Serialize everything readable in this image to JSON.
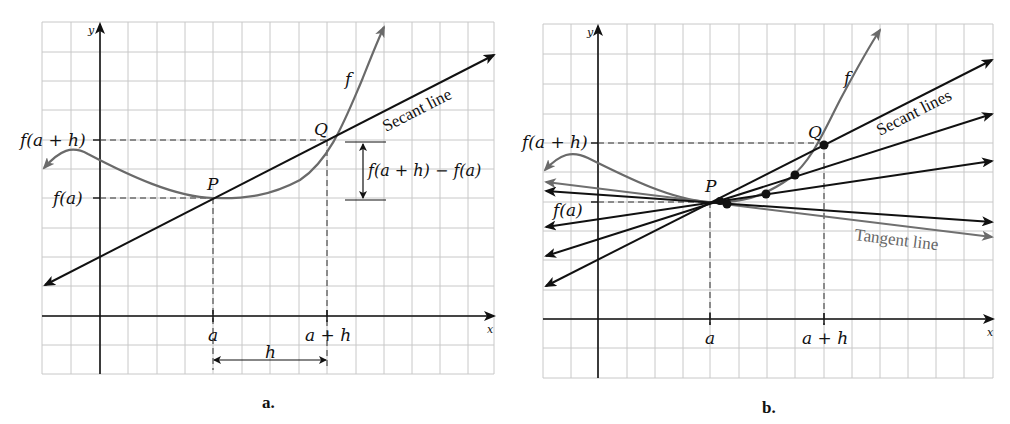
{
  "colors": {
    "grid": "#c8c8c8",
    "axis": "#111111",
    "curve": "#6a6a6a",
    "secant": "#111111",
    "tangent": "#707070",
    "text": "#111111"
  },
  "panel_a": {
    "caption": "a.",
    "axis_x_label": "x",
    "axis_y_label": "y",
    "curve_label": "f",
    "point_p_label": "P",
    "point_q_label": "Q",
    "y_tick_fah": "f(a + h)",
    "y_tick_fa": "f(a)",
    "x_tick_a": "a",
    "x_tick_ah": "a + h",
    "h_label": "h",
    "difference_label": "f(a + h) − f(a)",
    "secant_label": "Secant line"
  },
  "panel_b": {
    "caption": "b.",
    "axis_x_label": "x",
    "axis_y_label": "y",
    "curve_label": "f",
    "point_p_label": "P",
    "point_q_label": "Q",
    "y_tick_fah": "f(a + h)",
    "y_tick_fa": "f(a)",
    "x_tick_a": "a",
    "x_tick_ah": "a + h",
    "secant_label": "Secant lines",
    "tangent_label": "Tangent line"
  }
}
